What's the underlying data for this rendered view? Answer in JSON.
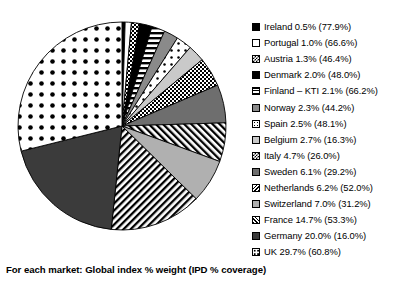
{
  "caption": "For each market: Global index % weight  (IPD % coverage)",
  "chart_data": {
    "type": "pie",
    "title": "",
    "subtitle": "",
    "xlabel": "",
    "ylabel": "",
    "legend_position": "right",
    "value_unit": "%",
    "note": "Global index % weight with IPD % coverage in parentheses",
    "start_angle_deg": 0,
    "direction": "clockwise",
    "categories": [
      "Ireland",
      "Portugal",
      "Austria",
      "Denmark",
      "Finland – KTI",
      "Norway",
      "Spain",
      "Belgium",
      "Italy",
      "Sweden",
      "Netherlands",
      "Switzerland",
      "France",
      "Germany",
      "UK"
    ],
    "values": [
      0.5,
      1.0,
      1.3,
      2.0,
      2.1,
      2.3,
      2.5,
      2.7,
      4.7,
      6.1,
      6.2,
      7.0,
      14.7,
      20.0,
      29.7
    ],
    "coverage": [
      77.9,
      66.6,
      46.4,
      48.0,
      66.2,
      44.2,
      48.1,
      16.3,
      26.0,
      29.2,
      52.0,
      31.2,
      53.3,
      16.0,
      60.8
    ],
    "slices": [
      {
        "label": "Ireland",
        "value": 0.5,
        "coverage": 77.9,
        "pattern": "solid-black",
        "text": "Ireland  0.5% (77.9%)"
      },
      {
        "label": "Portugal",
        "value": 1.0,
        "coverage": 66.6,
        "pattern": "white",
        "text": "Portugal  1.0% (66.6%)"
      },
      {
        "label": "Austria",
        "value": 1.3,
        "coverage": 46.4,
        "pattern": "checker-fine",
        "text": "Austria  1.3% (46.4%)"
      },
      {
        "label": "Denmark",
        "value": 2.0,
        "coverage": 48.0,
        "pattern": "solid-black",
        "text": "Denmark  2.0% (48.0%)"
      },
      {
        "label": "Finland – KTI",
        "value": 2.1,
        "coverage": 66.2,
        "pattern": "horizontal",
        "text": "Finland – KTI  2.1% (66.2%)"
      },
      {
        "label": "Norway",
        "value": 2.3,
        "coverage": 44.2,
        "pattern": "gray-dark",
        "text": "Norway  2.3% (44.2%)"
      },
      {
        "label": "Spain",
        "value": 2.5,
        "coverage": 48.1,
        "pattern": "dots-sparse",
        "text": "Spain  2.5% (48.1%)"
      },
      {
        "label": "Belgium",
        "value": 2.7,
        "coverage": 16.3,
        "pattern": "gray-light",
        "text": "Belgium  2.7% (16.3%)"
      },
      {
        "label": "Italy",
        "value": 4.7,
        "coverage": 26.0,
        "pattern": "checker-fine",
        "text": "Italy  4.7% (26.0%)"
      },
      {
        "label": "Sweden",
        "value": 6.1,
        "coverage": 29.2,
        "pattern": "gray-darker",
        "text": "Sweden  6.1% (29.2%)"
      },
      {
        "label": "Netherlands",
        "value": 6.2,
        "coverage": 52.0,
        "pattern": "diagonal-back",
        "text": "Netherlands  6.2% (52.0%)"
      },
      {
        "label": "Switzerland",
        "value": 7.0,
        "coverage": 31.2,
        "pattern": "gray-mid",
        "text": "Switzerland  7.0% (31.2%)"
      },
      {
        "label": "France",
        "value": 14.7,
        "coverage": 53.3,
        "pattern": "diagonal-fwd",
        "text": "France  14.7% (53.3%)"
      },
      {
        "label": "Germany",
        "value": 20.0,
        "coverage": 16.0,
        "pattern": "solid-dark",
        "text": "Germany  20.0% (16.0%)"
      },
      {
        "label": "UK",
        "value": 29.7,
        "coverage": 60.8,
        "pattern": "dots-bold",
        "text": "UK  29.7% (60.8%)"
      }
    ]
  },
  "colors": {
    "outline": "#000000",
    "background": "#ffffff",
    "gray_light": "#c9c9c9",
    "gray_mid": "#b0b0b0",
    "gray_dark": "#8a8a8a",
    "gray_darker": "#6e6e6e",
    "solid_dark": "#3b3b3b"
  }
}
